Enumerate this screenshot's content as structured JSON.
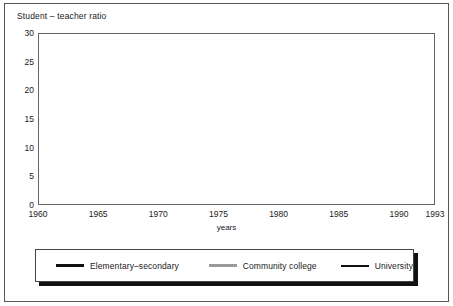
{
  "chart_title": "Student – teacher ratio",
  "axis": {
    "x_caption": "years",
    "y_ticks": [
      "30",
      "25",
      "20",
      "15",
      "10",
      "5",
      "0"
    ],
    "x_ticks": [
      "1960",
      "1965",
      "1970",
      "1975",
      "1980",
      "1985",
      "1990",
      "1993"
    ]
  },
  "legend": {
    "items": [
      {
        "label": "Elementary–secondary",
        "color": "#111111",
        "style": "thick"
      },
      {
        "label": "Community college",
        "color": "#9a9a9a",
        "style": "medium"
      },
      {
        "label": "University",
        "color": "#111111",
        "style": "thin"
      }
    ]
  },
  "chart_data": {
    "type": "line",
    "title": "Student – teacher ratio",
    "xlabel": "years",
    "ylabel": "Student – teacher ratio",
    "xlim": [
      1960,
      1993
    ],
    "ylim": [
      0,
      30
    ],
    "grid": true,
    "legend_position": "bottom",
    "x": [
      1960,
      1961,
      1962,
      1963,
      1964,
      1965,
      1966,
      1967,
      1968,
      1969,
      1970,
      1971,
      1972,
      1973,
      1974,
      1975,
      1976,
      1977,
      1978,
      1979,
      1980,
      1981,
      1982,
      1983,
      1984,
      1985,
      1986,
      1987,
      1988,
      1989,
      1990,
      1991,
      1992,
      1993
    ],
    "series": [
      {
        "name": "Elementary–secondary",
        "color": "#111111",
        "values": [
          25.5,
          25.3,
          24.9,
          24.6,
          24.4,
          24.6,
          24.0,
          23.3,
          22.6,
          21.0,
          21.2,
          21.2,
          20.9,
          20.6,
          20.3,
          19.9,
          19.5,
          19.1,
          18.9,
          18.6,
          18.5,
          18.2,
          18.1,
          18.2,
          18.4,
          18.4,
          18.3,
          18.1,
          17.9,
          17.5,
          17.3,
          17.8,
          17.9,
          17.9
        ]
      },
      {
        "name": "Community college",
        "color": "#9a9a9a",
        "values": [
          12.2,
          12.1,
          12.5,
          13.7,
          13.8,
          13.5,
          13.1,
          12.8,
          13.4,
          13.6,
          13.1,
          13.4,
          12.4,
          12.0,
          12.5,
          12.1,
          12.9,
          13.1,
          12.4,
          12.6,
          11.8,
          12.4,
          13.0,
          13.4,
          13.7,
          14.0,
          13.5,
          13.6,
          12.9,
          13.2,
          13.5,
          13.5,
          13.5,
          13.6
        ]
      },
      {
        "name": "University",
        "color": "#111111",
        "values": [
          14.8,
          14.8,
          14.7,
          14.6,
          14.4,
          14.1,
          13.7,
          13.4,
          13.3,
          13.3,
          13.1,
          12.5,
          11.9,
          11.7,
          11.7,
          12.0,
          12.1,
          12.2,
          12.2,
          11.9,
          11.7,
          12.1,
          12.6,
          13.0,
          13.3,
          13.4,
          13.5,
          13.7,
          14.0,
          14.3,
          14.7,
          15.1,
          15.3,
          15.5
        ]
      }
    ]
  }
}
